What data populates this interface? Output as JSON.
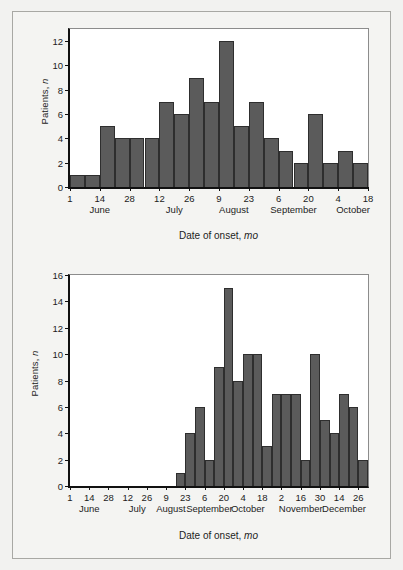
{
  "figure": {
    "background": "#f2f2f0",
    "frame_color": "#a8a8a4",
    "bar_color": "#5b5b5b",
    "bar_edge_color": "#2e2e2e",
    "axis_color": "#111111"
  },
  "chart_data": [
    {
      "id": "panel-a",
      "type": "bar",
      "title": "",
      "xlabel": "Date of onset, mo",
      "xlabel_italic_suffix": "mo",
      "ylabel": "Patients, n",
      "ylabel_italic_suffix": "n",
      "ylim": [
        0,
        13
      ],
      "yticks": [
        0,
        2,
        4,
        6,
        8,
        10,
        12
      ],
      "grid": false,
      "legend": "none",
      "x_unit": "week",
      "x_tick_labels": [
        "1",
        "14",
        "28",
        "12",
        "26",
        "9",
        "23",
        "6",
        "20",
        "4",
        "18"
      ],
      "x_tick_weeks": [
        0,
        2,
        4,
        6,
        8,
        10,
        12,
        14,
        16,
        18,
        20
      ],
      "month_labels": [
        {
          "label": "June",
          "week": 2
        },
        {
          "label": "July",
          "week": 7
        },
        {
          "label": "August",
          "week": 11
        },
        {
          "label": "September",
          "week": 15
        },
        {
          "label": "October",
          "week": 19
        }
      ],
      "categories": [
        "1 Jun",
        "8 Jun",
        "15 Jun",
        "22 Jun",
        "29 Jun",
        "6 Jul",
        "13 Jul",
        "20 Jul",
        "27 Jul",
        "3 Aug",
        "10 Aug",
        "17 Aug",
        "24 Aug",
        "31 Aug",
        "7 Sep",
        "14 Sep",
        "21 Sep",
        "28 Sep",
        "5 Oct",
        "12 Oct"
      ],
      "values": [
        1,
        1,
        5,
        4,
        4,
        4,
        7,
        6,
        9,
        7,
        12,
        5,
        7,
        4,
        3,
        2,
        6,
        2,
        3,
        2
      ],
      "n_bars": 20
    },
    {
      "id": "panel-b",
      "type": "bar",
      "title": "",
      "xlabel": "Date of onset, mo",
      "xlabel_italic_suffix": "mo",
      "ylabel": "Patients, n",
      "ylabel_italic_suffix": "n",
      "ylim": [
        0,
        16
      ],
      "yticks": [
        0,
        2,
        4,
        6,
        8,
        10,
        12,
        14,
        16
      ],
      "grid": false,
      "legend": "none",
      "x_unit": "week",
      "x_tick_labels": [
        "1",
        "14",
        "28",
        "12",
        "26",
        "9",
        "23",
        "6",
        "20",
        "4",
        "18",
        "2",
        "16",
        "30",
        "14",
        "26"
      ],
      "x_tick_weeks": [
        0,
        2,
        4,
        6,
        8,
        10,
        12,
        14,
        16,
        18,
        20,
        22,
        24,
        26,
        28,
        30
      ],
      "month_labels": [
        {
          "label": "June",
          "week": 2
        },
        {
          "label": "July",
          "week": 7
        },
        {
          "label": "August",
          "week": 10.5
        },
        {
          "label": "September",
          "week": 14.5
        },
        {
          "label": "October",
          "week": 18.5
        },
        {
          "label": "November",
          "week": 24
        },
        {
          "label": "December",
          "week": 28.5
        }
      ],
      "categories": [
        "1 Jun",
        "8 Jun",
        "15 Jun",
        "22 Jun",
        "29 Jun",
        "6 Jul",
        "13 Jul",
        "20 Jul",
        "27 Jul",
        "3 Aug",
        "10 Aug",
        "17 Aug",
        "24 Aug",
        "31 Aug",
        "7 Sep",
        "14 Sep",
        "21 Sep",
        "28 Sep",
        "5 Oct",
        "12 Oct",
        "19 Oct",
        "26 Oct",
        "2 Nov",
        "9 Nov",
        "16 Nov",
        "23 Nov",
        "30 Nov",
        "7 Dec",
        "14 Dec",
        "21 Dec",
        "28 Dec"
      ],
      "values": [
        0,
        0,
        0,
        0,
        0,
        0,
        0,
        0,
        0,
        0,
        0,
        1,
        4,
        6,
        2,
        9,
        15,
        8,
        10,
        10,
        3,
        7,
        7,
        7,
        2,
        10,
        5,
        4,
        7,
        6,
        2
      ],
      "n_bars": 31
    }
  ]
}
